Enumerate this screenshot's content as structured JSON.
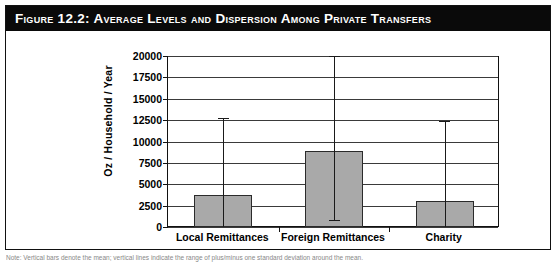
{
  "figure": {
    "title": "Figure 12.2:  Average Levels and Dispersion Among Private Transfers",
    "caption": "Note: Vertical bars denote the mean; vertical lines indicate the range of plus/minus one standard deviation around the mean."
  },
  "chart_data": {
    "type": "bar",
    "title": "Average Levels and Dispersion Among Private Transfers",
    "xlabel": "",
    "ylabel": "Oz / Household / Year",
    "categories": [
      "Local Remittances",
      "Foreign Remittances",
      "Charity"
    ],
    "values": [
      3700,
      8900,
      3000
    ],
    "series": [
      {
        "name": "Mean",
        "values": [
          3700,
          8900,
          3000
        ]
      }
    ],
    "error_bars": {
      "type": "range",
      "lower": [
        0,
        850,
        0
      ],
      "upper": [
        12700,
        20000,
        12400
      ],
      "note": "Foreign Remittances upper whisker is clipped at the top of the plot area"
    },
    "ylim": [
      0,
      20000
    ],
    "yticks": [
      0,
      2500,
      5000,
      7500,
      10000,
      12500,
      15000,
      17500,
      20000
    ],
    "ytick_labels": [
      "0",
      "2500",
      "5000",
      "7500",
      "10000",
      "12500",
      "15000",
      "17500",
      "20000"
    ],
    "grid": true,
    "legend": false,
    "bar_color": "#a9a9a9",
    "bar_border_color": "#2b2b2b",
    "error_bar_color": "#1a1a1a",
    "plot_background": "#ffffff"
  }
}
